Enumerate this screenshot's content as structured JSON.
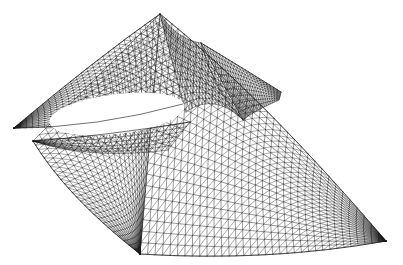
{
  "figure": {
    "kind": "surface-wireframe",
    "width": 403,
    "height": 265,
    "background_color": "#ffffff",
    "line_color": "#1a1a1a",
    "boundary_color": "#111111",
    "line_width": 0.45,
    "diagonal_line_width": 0.38,
    "shading": "none",
    "has_axes": false,
    "has_labels": false,
    "has_legend": false,
    "has_text": false
  },
  "chart_data": {
    "type": "line",
    "title": "",
    "xlabel": "",
    "ylabel": "",
    "render_style": "triangulated wireframe, black lines on white, no fill",
    "mesh": {
      "u_divisions": 34,
      "v_divisions": 26,
      "cell_shape": "quadrilateral with single diagonal",
      "diagonal_direction": "lower-left to upper-right"
    },
    "projection": {
      "type": "orthographic",
      "scale": 1.0,
      "azimuth_deg": 38,
      "elevation_deg": 22
    },
    "features": [
      {
        "name": "top-apex",
        "x": 160,
        "y": 14,
        "kind": "sharp peak"
      },
      {
        "name": "secondary-peak",
        "x": 201,
        "y": 43,
        "kind": "sharp peak"
      },
      {
        "name": "upper-left-cusp-tip",
        "x": 14,
        "y": 128,
        "kind": "cusp blade tip"
      },
      {
        "name": "lower-left-cusp-tip",
        "x": 33,
        "y": 141,
        "kind": "cusp blade tip"
      },
      {
        "name": "bottom-centre-cusp",
        "x": 140,
        "y": 254,
        "kind": "downward cusp"
      },
      {
        "name": "right-needle-tip",
        "x": 386,
        "y": 241,
        "kind": "tapered point"
      },
      {
        "name": "elliptical-void",
        "cx": 117,
        "cy": 114,
        "rx": 68,
        "ry": 20,
        "kind": "white hole between sheets"
      },
      {
        "name": "fold-crease",
        "from_x": 201,
        "from_y": 43,
        "to_x": 243,
        "to_y": 120,
        "kind": "self-intersection crease"
      }
    ],
    "bounding_box": {
      "x_min": 12,
      "y_min": 12,
      "x_max": 390,
      "y_max": 258
    }
  }
}
